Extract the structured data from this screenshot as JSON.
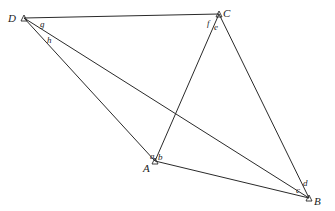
{
  "diagram": {
    "type": "geometry-quadrilateral",
    "vertices": [
      {
        "id": "D",
        "label": "D",
        "x": 24,
        "y": 18
      },
      {
        "id": "C",
        "label": "C",
        "x": 219,
        "y": 14
      },
      {
        "id": "A",
        "label": "A",
        "x": 155,
        "y": 161
      },
      {
        "id": "B",
        "label": "B",
        "x": 309,
        "y": 198
      }
    ],
    "segments": [
      [
        "D",
        "C"
      ],
      [
        "D",
        "A"
      ],
      [
        "D",
        "B"
      ],
      [
        "C",
        "A"
      ],
      [
        "C",
        "B"
      ],
      [
        "A",
        "B"
      ]
    ],
    "angle_labels": {
      "a": "a",
      "b": "b",
      "c": "c",
      "d": "d",
      "e": "e",
      "f": "f",
      "g": "g",
      "h": "h"
    },
    "vertex_labels": {
      "A": "A",
      "B": "B",
      "C": "C",
      "D": "D"
    }
  }
}
